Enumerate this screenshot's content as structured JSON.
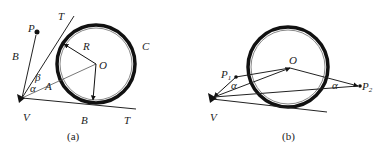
{
  "diagram_a": {
    "caption": "(a)",
    "labels": {
      "P": "P",
      "T_top": "T",
      "R": "R",
      "C": "C",
      "O": "O",
      "B_left": "B",
      "beta": "β",
      "alpha": "α",
      "A": "A",
      "V": "V",
      "B_bottom": "B",
      "T_bottom": "T"
    }
  },
  "diagram_b": {
    "caption": "(b)",
    "labels": {
      "O": "O",
      "P1": "P",
      "P1_sub": "1",
      "P2": "P",
      "P2_sub": "2",
      "alpha_left": "α",
      "alpha_right": "α",
      "V": "V"
    }
  }
}
